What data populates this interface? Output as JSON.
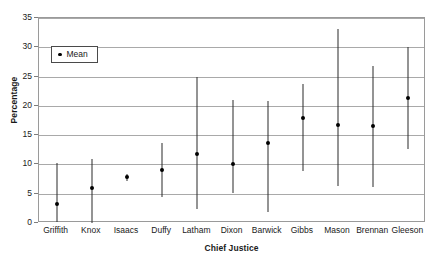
{
  "chart_data": {
    "type": "scatter",
    "title": "",
    "xlabel": "Chief Justice",
    "ylabel": "Percentage",
    "ylim": [
      0,
      35
    ],
    "yticks": [
      0,
      5,
      10,
      15,
      20,
      25,
      30,
      35
    ],
    "grid": true,
    "legend_position": "upper-left",
    "legend_entries": [
      "Mean"
    ],
    "categories": [
      "Griffith",
      "Knox",
      "Isaacs",
      "Duffy",
      "Latham",
      "Dixon",
      "Barwick",
      "Gibbs",
      "Mason",
      "Brennan",
      "Gleeson"
    ],
    "series": [
      {
        "name": "Mean",
        "values": [
          3.3,
          6.0,
          7.8,
          9.1,
          11.7,
          10.1,
          13.6,
          18.0,
          16.7,
          16.6,
          21.4
        ],
        "lower": [
          0.2,
          0.0,
          7.2,
          4.5,
          2.4,
          5.1,
          1.9,
          8.8,
          6.3,
          6.1,
          12.7
        ],
        "upper": [
          10.3,
          11.0,
          8.4,
          13.6,
          25.0,
          21.0,
          20.9,
          23.8,
          33.2,
          26.8,
          30.1
        ]
      }
    ]
  },
  "axes": {
    "y_tick_labels": [
      "35",
      "30",
      "25",
      "20",
      "15",
      "10",
      "5",
      "0"
    ],
    "y_title": "Percentage",
    "x_title": "Chief Justice"
  },
  "legend": {
    "mean_label": "Mean"
  },
  "title": {
    "clipped_text": ""
  },
  "colors": {
    "marker": "#000000",
    "errorbar": "#2b2b2b",
    "gridline": "#a9a9a9",
    "frame": "#9a9a9a",
    "background": "#ffffff",
    "text": "#1a1a1a"
  }
}
